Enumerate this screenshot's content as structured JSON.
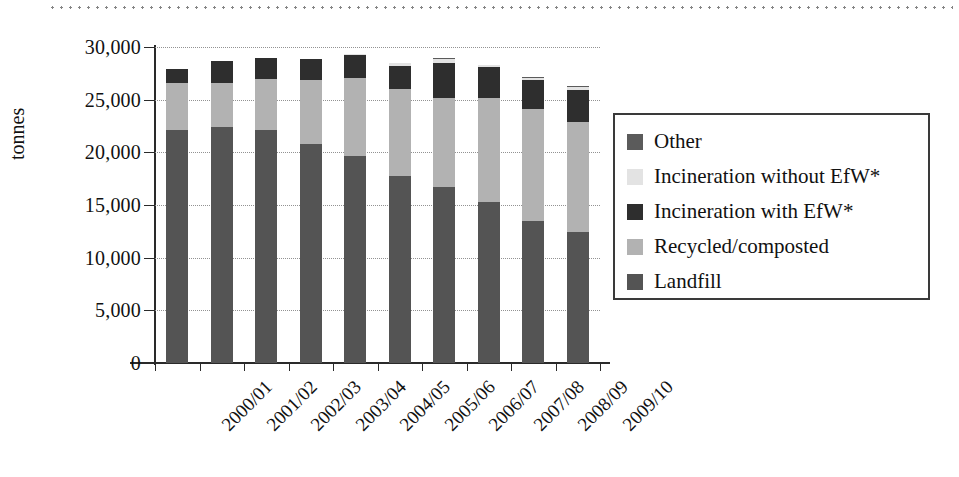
{
  "chart_data": {
    "type": "bar",
    "stacked": true,
    "title": "",
    "xlabel": "",
    "ylabel": "tonnes",
    "ylim": [
      0,
      30000
    ],
    "yticks": [
      0,
      5000,
      10000,
      15000,
      20000,
      25000,
      30000
    ],
    "ytick_labels": [
      "0",
      "5,000",
      "10,000",
      "15,000",
      "20,000",
      "25,000",
      "30,000"
    ],
    "grid": "horizontal-dotted",
    "legend_position": "right",
    "categories": [
      "2000/01",
      "2001/02",
      "2002/03",
      "2003/04",
      "2004/05",
      "2005/06",
      "2006/07",
      "2007/08",
      "2008/09",
      "2009/10"
    ],
    "series": [
      {
        "name": "Landfill",
        "color": "#545454",
        "values": [
          22100,
          22400,
          22100,
          20800,
          19700,
          17800,
          16700,
          15300,
          13500,
          12400
        ]
      },
      {
        "name": "Recycled/composted",
        "color": "#b2b2b2",
        "values": [
          4500,
          4200,
          4900,
          6100,
          7400,
          8200,
          8500,
          9900,
          10600,
          10500
        ]
      },
      {
        "name": "Incineration with EfW*",
        "color": "#2e2e2e",
        "values": [
          1300,
          2100,
          2000,
          2000,
          2100,
          2200,
          3300,
          2900,
          2800,
          3000
        ]
      },
      {
        "name": "Incineration without EfW*",
        "color": "#e3e3e3",
        "values": [
          0,
          0,
          0,
          0,
          100,
          300,
          400,
          200,
          200,
          300
        ]
      },
      {
        "name": "Other",
        "color": "#5b5b5b",
        "values": [
          0,
          0,
          0,
          0,
          0,
          0,
          100,
          0,
          100,
          100
        ]
      }
    ],
    "totals": [
      27900,
      28700,
      29000,
      28900,
      29300,
      28500,
      29000,
      28300,
      27200,
      26300
    ],
    "legend_order": [
      "Other",
      "Incineration without EfW*",
      "Incineration with EfW*",
      "Recycled/composted",
      "Landfill"
    ]
  },
  "legend": {
    "items": [
      {
        "label": "Other",
        "swatch": "other-swatch"
      },
      {
        "label": "Incineration without EfW*",
        "swatch": "incineration-without-efw-swatch"
      },
      {
        "label": "Incineration with EfW*",
        "swatch": "incineration-with-efw-swatch"
      },
      {
        "label": "Recycled/composted",
        "swatch": "recycled-composted-swatch"
      },
      {
        "label": "Landfill",
        "swatch": "landfill-swatch"
      }
    ]
  }
}
